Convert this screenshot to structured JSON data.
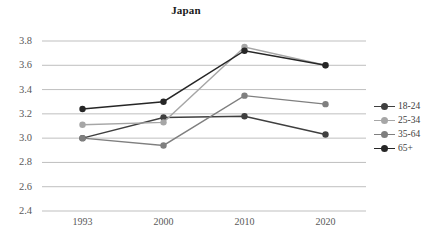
{
  "chart_data": {
    "type": "line",
    "title": "Japan",
    "xlabel": "",
    "ylabel": "",
    "categories": [
      "1993",
      "2000",
      "2010",
      "2020"
    ],
    "ylim": [
      2.4,
      3.8
    ],
    "ytick_labels": [
      "3.8",
      "3.6",
      "3.4",
      "3.2",
      "3.0",
      "2.8",
      "2.6",
      "2.4"
    ],
    "ytick_values": [
      3.8,
      3.6,
      3.4,
      3.2,
      3.0,
      2.8,
      2.6,
      2.4
    ],
    "grid": true,
    "legend_position": "right",
    "series": [
      {
        "name": "18-24",
        "color": "#3f3f3f",
        "values": [
          3.0,
          3.17,
          3.18,
          3.03
        ]
      },
      {
        "name": "25-34",
        "color": "#a6a6a6",
        "values": [
          3.11,
          3.13,
          3.75,
          3.6
        ]
      },
      {
        "name": "35-64",
        "color": "#7f7f7f",
        "values": [
          3.0,
          2.94,
          3.35,
          3.28
        ]
      },
      {
        "name": "65+",
        "color": "#262626",
        "values": [
          3.24,
          3.3,
          3.72,
          3.6
        ]
      }
    ]
  },
  "colors": {
    "gridline": "#bfbfbf",
    "axis": "#bfbfbf",
    "tick_text": "#595959",
    "title_text": "#1a1a1a",
    "background": "#ffffff"
  }
}
